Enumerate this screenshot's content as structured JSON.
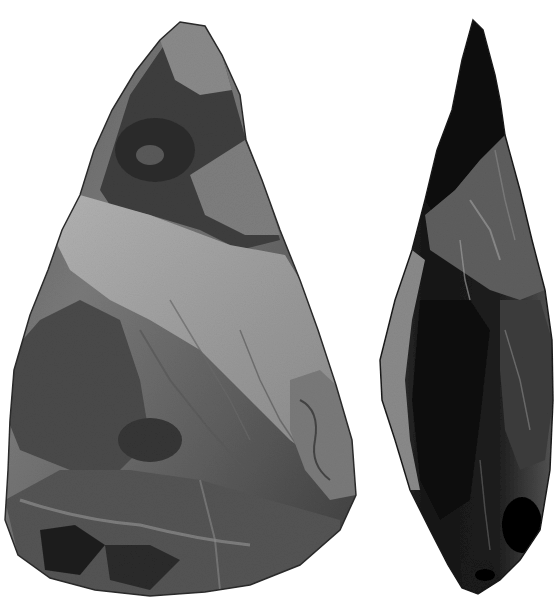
{
  "image": {
    "description": "Black and white photograph of two flint hand axes",
    "width": 554,
    "height": 609,
    "background": "#ffffff"
  },
  "objects": [
    {
      "name": "hand-axe-face-view",
      "label": "Hand axe (face view)",
      "tone_light": "#a8a8a8",
      "tone_mid": "#6e6e6e",
      "tone_dark": "#262626"
    },
    {
      "name": "hand-axe-side-view",
      "label": "Hand axe (side view)",
      "tone_light": "#8a8a8a",
      "tone_mid": "#3a3a3a",
      "tone_dark": "#0c0c0c"
    }
  ]
}
